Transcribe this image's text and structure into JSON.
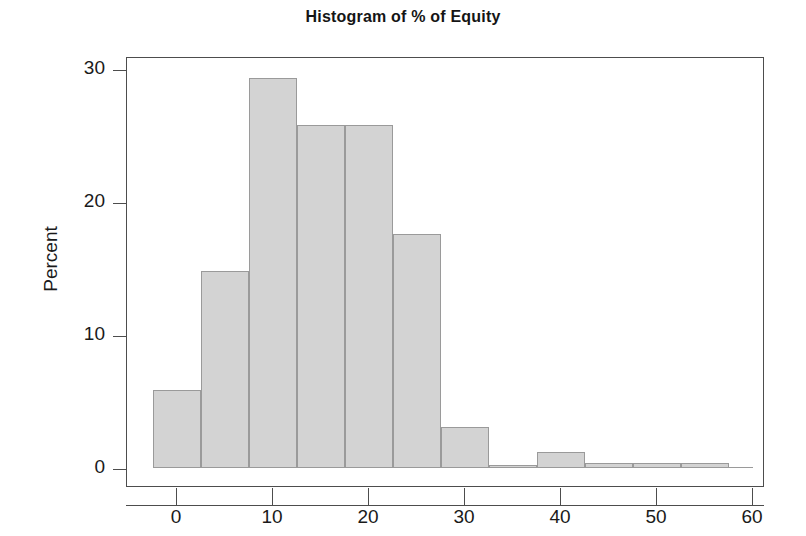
{
  "chart_data": {
    "type": "bar",
    "title": "Histogram of % of Equity",
    "xlabel": "",
    "ylabel": "Percent",
    "xlim": [
      -4,
      60
    ],
    "ylim": [
      0,
      31
    ],
    "grid": false,
    "legend": "none",
    "bin_width": 5,
    "bin_starts": [
      -2.5,
      2.5,
      7.5,
      12.5,
      17.5,
      22.5,
      27.5,
      32.5,
      37.5,
      42.5,
      47.5,
      52.5
    ],
    "bin_ends": [
      2.5,
      7.5,
      12.5,
      17.5,
      22.5,
      27.5,
      32.5,
      37.5,
      42.5,
      47.5,
      52.5,
      57.5
    ],
    "categories": [
      "-2.5 to 2.5",
      "2.5 to 7.5",
      "7.5 to 12.5",
      "12.5 to 17.5",
      "17.5 to 22.5",
      "22.5 to 27.5",
      "27.5 to 32.5",
      "32.5 to 37.5",
      "37.5 to 42.5",
      "42.5 to 47.5",
      "47.5 to 52.5",
      "52.5 to 57.5"
    ],
    "values": [
      5.9,
      14.8,
      29.3,
      25.8,
      25.8,
      17.6,
      3.1,
      0.2,
      1.2,
      0.4,
      0.4,
      0.4
    ],
    "bars": [
      {
        "start": -2.5,
        "end": 2.5,
        "value": 5.9
      },
      {
        "start": 2.5,
        "end": 7.5,
        "value": 14.8
      },
      {
        "start": 7.5,
        "end": 12.5,
        "value": 29.3
      },
      {
        "start": 12.5,
        "end": 17.5,
        "value": 25.8
      },
      {
        "start": 17.5,
        "end": 22.5,
        "value": 25.8
      },
      {
        "start": 22.5,
        "end": 27.5,
        "value": 17.6
      },
      {
        "start": 27.5,
        "end": 32.5,
        "value": 3.1
      },
      {
        "start": 32.5,
        "end": 37.5,
        "value": 0.2
      },
      {
        "start": 37.5,
        "end": 42.5,
        "value": 1.2
      },
      {
        "start": 42.5,
        "end": 47.5,
        "value": 0.4
      },
      {
        "start": 47.5,
        "end": 52.5,
        "value": 0.4
      },
      {
        "start": 52.5,
        "end": 57.5,
        "value": 0.4
      }
    ],
    "x_ticks": [
      0,
      10,
      20,
      30,
      40,
      50,
      60
    ],
    "x_tick_labels": [
      "0",
      "10",
      "20",
      "30",
      "40",
      "50",
      "60"
    ],
    "y_ticks": [
      0,
      10,
      20,
      30
    ],
    "y_tick_labels": [
      "0",
      "10",
      "20",
      "30"
    ],
    "colors": {
      "bar_fill": "#d3d3d3",
      "bar_stroke": "#9a9a9a",
      "axis": "#4d4d4d",
      "text": "#1a1a1a",
      "background": "#ffffff"
    }
  }
}
